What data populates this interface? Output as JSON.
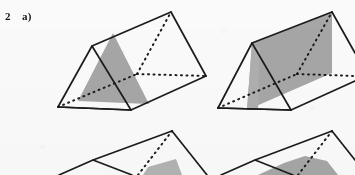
{
  "figure": {
    "exercise_number": "2",
    "part_label": "a)",
    "caption": "",
    "colors": {
      "ink": "#1b1b1b",
      "shade_fill": "#a8a8a8",
      "shade_fill_light": "#b4b4b4",
      "paper": "#fdfdfd"
    },
    "line_styles": {
      "visible_edge": "solid",
      "hidden_edge": "dotted"
    },
    "objects": [
      {
        "id": "prism-top-left",
        "name": "triangular-prism-1",
        "row": "top",
        "column": "left",
        "cropped": false,
        "shaded_region": "triangle",
        "shaded_description": "upright triangular cross-section on the near-right lateral face",
        "vertices": {
          "front_apex": [
            92,
            46
          ],
          "front_bottom_left": [
            58,
            107
          ],
          "front_bottom_right": [
            131,
            110
          ],
          "back_apex": [
            171,
            12
          ],
          "back_bottom_left": [
            137,
            74
          ],
          "back_bottom_right": [
            206,
            76
          ]
        },
        "shade_polygon": [
          [
            113,
            33
          ],
          [
            149,
            104
          ],
          [
            78,
            101
          ]
        ]
      },
      {
        "id": "prism-top-right",
        "name": "triangular-prism-2",
        "row": "top",
        "column": "right",
        "cropped": true,
        "shaded_region": "quadrilateral",
        "shaded_description": "large slanted plane cutting from the bottom edge up to the back ridge",
        "vertices": {
          "front_apex": [
            252,
            43
          ],
          "front_bottom_left": [
            218,
            108
          ],
          "front_bottom_right": [
            291,
            110
          ],
          "back_apex": [
            332,
            12
          ],
          "back_bottom_left": [
            297,
            74
          ],
          "back_bottom_right": [
            355,
            76
          ]
        },
        "shade_polygon": [
          [
            252,
            43
          ],
          [
            332,
            12
          ],
          [
            332,
            73
          ],
          [
            247,
            110
          ]
        ]
      },
      {
        "id": "prism-bottom-left",
        "name": "triangular-prism-3",
        "row": "bottom",
        "column": "left",
        "cropped": true,
        "shaded_region": "thin-sliver",
        "shaded_description": "narrow shaded strip near the lower part of the cut, mostly below the image crop",
        "vertices": {
          "front_apex": [
            93,
            160
          ],
          "front_bottom_left": [
            59,
            175
          ],
          "front_bottom_right": [
            132,
            175
          ],
          "back_apex": [
            172,
            131
          ],
          "back_bottom_left": [
            138,
            175
          ],
          "back_bottom_right": [
            207,
            175
          ]
        },
        "shade_polygon": [
          [
            150,
            166
          ],
          [
            175,
            160
          ],
          [
            178,
            175
          ],
          [
            146,
            175
          ]
        ]
      },
      {
        "id": "prism-bottom-right",
        "name": "triangular-prism-4",
        "row": "bottom",
        "column": "right",
        "cropped": true,
        "shaded_region": "mound",
        "shaded_description": "broad shaded region rising toward the cut line, cropped by the bottom of the image",
        "vertices": {
          "front_apex": [
            255,
            160
          ],
          "front_bottom_left": [
            221,
            175
          ],
          "front_bottom_right": [
            293,
            175
          ],
          "back_apex": [
            332,
            131
          ],
          "back_bottom_left": [
            298,
            175
          ],
          "back_bottom_right": [
            355,
            175
          ]
        },
        "shade_polygon": [
          [
            262,
            175
          ],
          [
            300,
            158
          ],
          [
            330,
            162
          ],
          [
            336,
            175
          ]
        ]
      }
    ]
  }
}
